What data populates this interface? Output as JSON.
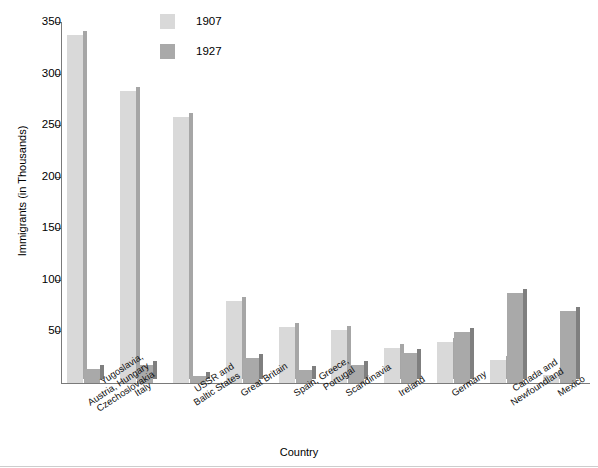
{
  "chart_data": {
    "type": "bar",
    "title": "",
    "xlabel": "Country",
    "ylabel": "Immigrants (in Thousands)",
    "ylim": [
      0,
      350
    ],
    "yticks": [
      50,
      100,
      150,
      200,
      250,
      300,
      350
    ],
    "grid": false,
    "legend_position": "top-center",
    "categories": [
      "Yugoslavia,\nAustria, Hungary\nCzechoslovakia",
      "Italy",
      "USSR and\nBaltic States",
      "Great Britain",
      "Spain, Greece,\nPortugal",
      "Scandinavia",
      "Ireland",
      "Germany",
      "Canada and\nNewfoundland",
      "Mexico"
    ],
    "series": [
      {
        "name": "1907",
        "color": "#d9d9d9",
        "side_color": "#a6a6a6",
        "values": [
          337,
          283,
          258,
          80,
          54,
          51,
          34,
          40,
          22,
          8
        ]
      },
      {
        "name": "1927",
        "color": "#a9a9a9",
        "side_color": "#7f7f7f",
        "values": [
          14,
          17,
          7,
          24,
          13,
          17,
          29,
          49,
          87,
          70
        ]
      }
    ]
  },
  "axis": {
    "y_label": "Immigrants (in Thousands)",
    "x_label": "Country",
    "y_tick_labels": [
      "50",
      "100",
      "150",
      "200",
      "250",
      "300",
      "350"
    ]
  },
  "legend": {
    "entries": [
      {
        "label": "1907",
        "color": "#d9d9d9"
      },
      {
        "label": "1927",
        "color": "#a9a9a9"
      }
    ]
  },
  "colors": {
    "series_1907": "#d9d9d9",
    "series_1927": "#a9a9a9",
    "axis": "#7a7a7a",
    "background": "#ffffff"
  }
}
